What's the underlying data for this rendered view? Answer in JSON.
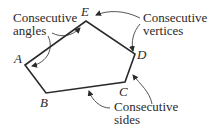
{
  "diagram": {
    "type": "pentagon",
    "vertices": [
      {
        "name": "A",
        "x": 25,
        "y": 65
      },
      {
        "name": "B",
        "x": 46,
        "y": 93
      },
      {
        "name": "C",
        "x": 125,
        "y": 82
      },
      {
        "name": "D",
        "x": 135,
        "y": 54
      },
      {
        "name": "E",
        "x": 86,
        "y": 21
      }
    ],
    "labels": {
      "vertex_a": "A",
      "vertex_b": "B",
      "vertex_c": "C",
      "vertex_d": "D",
      "vertex_e": "E",
      "angles_line1": "Consecutive",
      "angles_line2": "angles",
      "vertices_line1": "Consecutive",
      "vertices_line2": "vertices",
      "sides_line1": "Consecutive",
      "sides_line2": "sides"
    },
    "colors": {
      "stroke": "#2a2a2a",
      "background": "#ffffff"
    }
  }
}
